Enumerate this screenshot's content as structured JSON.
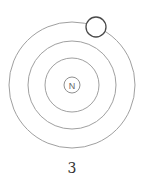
{
  "diagram": {
    "type": "atom-shell-model",
    "nucleus": {
      "label": "N",
      "cx": 72,
      "cy": 85,
      "r": 8
    },
    "shells": [
      {
        "name": "inner",
        "r": 27
      },
      {
        "name": "middle",
        "r": 44
      },
      {
        "name": "outer",
        "r": 63
      }
    ],
    "electron": {
      "cx": 96,
      "cy": 27,
      "r": 10,
      "shell": "outer"
    },
    "caption": "3",
    "colors": {
      "shell": "#9a9a9a",
      "electron": "#444444",
      "nucleus": "#888888",
      "text": "#333333"
    }
  }
}
